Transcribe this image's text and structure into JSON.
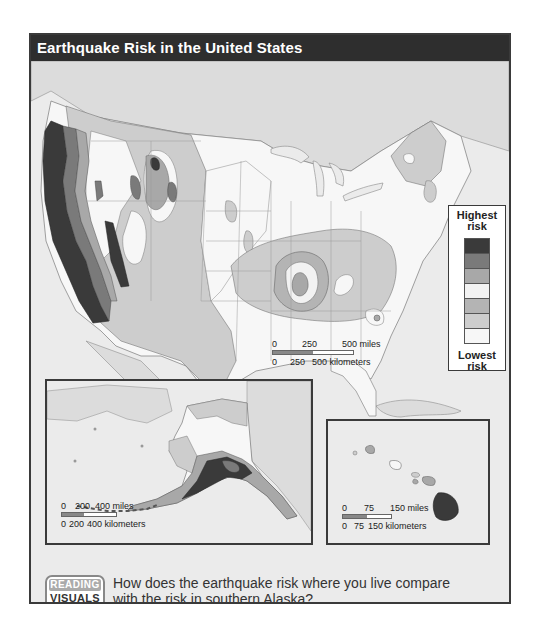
{
  "map": {
    "title": "Earthquake Risk in the United States",
    "legend": {
      "top_label_line1": "Highest",
      "top_label_line2": "risk",
      "bottom_label_line1": "Lowest",
      "bottom_label_line2": "risk",
      "levels": [
        {
          "rank": 7,
          "color": "#3a3a3a"
        },
        {
          "rank": 6,
          "color": "#7a7a7a"
        },
        {
          "rank": 5,
          "color": "#a8a8a8"
        },
        {
          "rank": 4,
          "color": "#f2f2f2"
        },
        {
          "rank": 3,
          "color": "#b4b4b4"
        },
        {
          "rank": 2,
          "color": "#cdcdcd"
        },
        {
          "rank": 1,
          "color": "#f7f7f7"
        }
      ]
    },
    "main_scale": {
      "miles_labels": [
        "0",
        "250",
        "500 miles"
      ],
      "km_labels": [
        "0",
        "250",
        "500 kilometers"
      ]
    },
    "alaska_inset": {
      "name": "Alaska",
      "scale": {
        "miles_labels": [
          "0",
          "200",
          "400 miles"
        ],
        "km_labels": [
          "0",
          "200",
          "400 kilometers"
        ]
      }
    },
    "hawaii_inset": {
      "name": "Hawaii",
      "scale": {
        "miles_labels": [
          "0",
          "75",
          "150 miles"
        ],
        "km_labels": [
          "0",
          "75",
          "150 kilometers"
        ]
      }
    },
    "reading_visuals": {
      "badge_line1": "READING",
      "badge_line2": "VISUALS",
      "question": "How does the earthquake risk where you live compare with the risk in southern Alaska?"
    }
  }
}
